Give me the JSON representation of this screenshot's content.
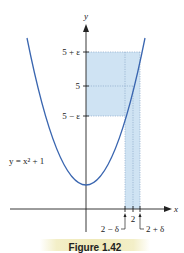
{
  "figure": {
    "caption": "Figure 1.42",
    "curve_label": "y = x² + 1",
    "axis_labels": {
      "x": "x",
      "y": "y"
    },
    "y_ticks": [
      {
        "label": "5 + ε",
        "value": "5+eps"
      },
      {
        "label": "5",
        "value": "5"
      },
      {
        "label": "5 − ε",
        "value": "5-eps"
      }
    ],
    "x_ticks": [
      {
        "label": "2 − δ",
        "value": "2-delta"
      },
      {
        "label": "2",
        "value": "2"
      },
      {
        "label": "2 + δ",
        "value": "2+delta"
      }
    ],
    "colors": {
      "curve": "#3a66b0",
      "shade": "#cfe3f3",
      "axis": "#222222",
      "dotted": "#8aa8c8",
      "caption_bg": "#efe9b8"
    }
  }
}
